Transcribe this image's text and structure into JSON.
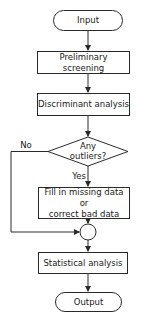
{
  "diagram": {
    "type": "flowchart",
    "nodes": {
      "input": {
        "label": "Input",
        "shape": "terminal"
      },
      "screening": {
        "label": "Preliminary screening",
        "shape": "process"
      },
      "discriminant": {
        "label": "Discriminant analysis",
        "shape": "process"
      },
      "decision": {
        "line1": "Any",
        "line2": "outliers?",
        "shape": "decision"
      },
      "fill": {
        "line1": "Fill in missing data or",
        "line2": "correct bad data",
        "shape": "process"
      },
      "statistical": {
        "label": "Statistical analysis",
        "shape": "process"
      },
      "output": {
        "label": "Output",
        "shape": "terminal"
      }
    },
    "edge_labels": {
      "no": "No",
      "yes": "Yes"
    },
    "colors": {
      "stroke": "#2a2a2a",
      "background": "#ffffff",
      "text": "#1a1a1a"
    }
  }
}
